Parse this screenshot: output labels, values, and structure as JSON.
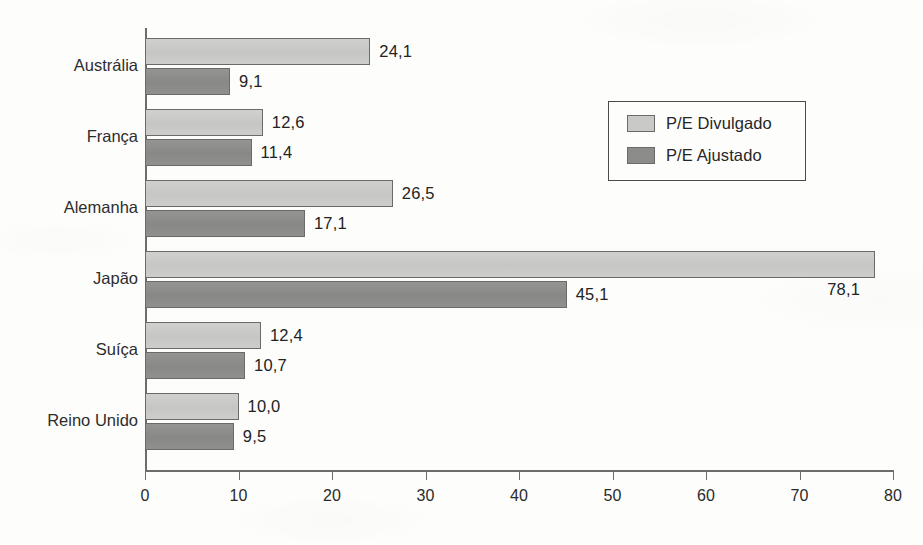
{
  "chart_data": {
    "type": "bar",
    "orientation": "horizontal",
    "title": "",
    "subtitle": "",
    "xlabel": "",
    "ylabel": "",
    "xlim": [
      0,
      80
    ],
    "xticks": [
      0,
      10,
      20,
      30,
      40,
      50,
      60,
      70,
      80
    ],
    "xtick_labels": [
      "0",
      "10",
      "20",
      "30",
      "40",
      "50",
      "60",
      "70",
      "80"
    ],
    "grid": false,
    "decimal_separator": ",",
    "legend_position": "upper-right-inset",
    "categories": [
      "Austrália",
      "França",
      "Alemanha",
      "Japão",
      "Suíça",
      "Reino Unido"
    ],
    "series": [
      {
        "name": "P/E Divulgado",
        "color": "#c9c9c7",
        "values": [
          24.1,
          12.6,
          26.5,
          78.1,
          12.4,
          10.0
        ],
        "value_labels": [
          "24,1",
          "12,6",
          "26,5",
          "78,1",
          "12,4",
          "10,0"
        ]
      },
      {
        "name": "P/E Ajustado",
        "color": "#8c8c8a",
        "values": [
          9.1,
          11.4,
          17.1,
          45.1,
          10.7,
          9.5
        ],
        "value_labels": [
          "9,1",
          "11,4",
          "17,1",
          "45,1",
          "10,7",
          "9,5"
        ]
      }
    ]
  },
  "legend": {
    "items": [
      {
        "label": "P/E Divulgado",
        "swatch": "light"
      },
      {
        "label": "P/E Ajustado",
        "swatch": "dark"
      }
    ]
  },
  "colors": {
    "series_light": "#c9c9c7",
    "series_dark": "#8c8c8a",
    "axis": "#6d6d6d",
    "text": "#2a2a2a",
    "background": "#fdfdfc",
    "legend_border": "#4a4a4a"
  }
}
